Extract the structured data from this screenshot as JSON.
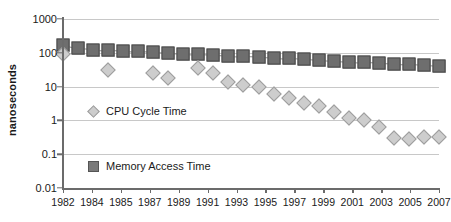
{
  "chart_data": {
    "type": "scatter",
    "title": "",
    "xlabel": "",
    "ylabel": "nanoseconds",
    "yscale": "log",
    "ylim": [
      0.01,
      1000
    ],
    "xlim": [
      1982,
      2007
    ],
    "grid": true,
    "legend_position": "inside-left",
    "y_ticks": [
      "1000",
      "100",
      "10",
      "1",
      "0.1",
      "0.01"
    ],
    "y_tick_values": [
      1000,
      100,
      10,
      1,
      0.1,
      0.01
    ],
    "x_ticks": [
      "1982",
      "1984",
      "1985",
      "1987",
      "1989",
      "1991",
      "1993",
      "1995",
      "1997",
      "1999",
      "2001",
      "2003",
      "2005",
      "2007"
    ],
    "x_tick_values": [
      1982,
      1984,
      1985,
      1987,
      1989,
      1991,
      1993,
      1995,
      1997,
      1999,
      2001,
      2003,
      2005,
      2007
    ],
    "series": [
      {
        "name": "Memory Access Time",
        "marker": "square",
        "color": "#6e6e6e",
        "x": [
          1982,
          1983,
          1984,
          1985,
          1986,
          1987,
          1988,
          1989,
          1990,
          1991,
          1992,
          1993,
          1994,
          1995,
          1996,
          1997,
          1998,
          1999,
          2000,
          2001,
          2002,
          2003,
          2004,
          2005,
          2006,
          2007
        ],
        "values": [
          170,
          135,
          125,
          120,
          115,
          110,
          105,
          100,
          95,
          90,
          85,
          82,
          78,
          75,
          72,
          68,
          65,
          62,
          58,
          55,
          52,
          50,
          48,
          46,
          44,
          42
        ]
      },
      {
        "name": "CPU Cycle Time",
        "marker": "diamond",
        "color": "#cdcdcd",
        "x": [
          1982,
          1985,
          1988,
          1989,
          1991,
          1992,
          1993,
          1994,
          1995,
          1996,
          1997,
          1998,
          1999,
          2000,
          2001,
          2002,
          2003,
          2004,
          2005,
          2006,
          2007
        ],
        "values": [
          90,
          30,
          25,
          18,
          35,
          25,
          14,
          11,
          9.5,
          6,
          4.5,
          3.3,
          2.6,
          1.8,
          1.2,
          1.0,
          0.65,
          0.3,
          0.28,
          0.33,
          0.33
        ]
      }
    ],
    "legend": [
      {
        "label": "CPU Cycle Time",
        "marker": "diamond"
      },
      {
        "label": "Memory Access Time",
        "marker": "square"
      }
    ]
  }
}
